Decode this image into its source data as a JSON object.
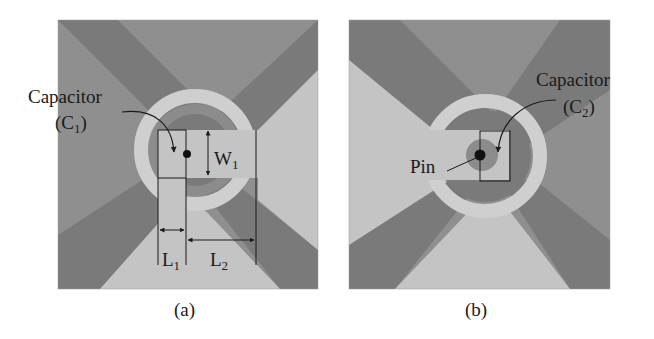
{
  "figure": {
    "panel_a": {
      "caption": "(a)",
      "capacitor_label": "Capacitor",
      "capacitor_sub_prefix": "(C",
      "capacitor_sub": "1",
      "capacitor_sub_suffix": ")",
      "dim_w1": "W",
      "dim_w1_sub": "1",
      "dim_l1": "L",
      "dim_l1_sub": "1",
      "dim_l2": "L",
      "dim_l2_sub": "2"
    },
    "panel_b": {
      "caption": "(b)",
      "capacitor_label": "Capacitor",
      "capacitor_sub_prefix": "(C",
      "capacitor_sub": "2",
      "capacitor_sub_suffix": ")",
      "pin_label": "Pin"
    },
    "colors": {
      "background": "#ffffff",
      "dark_gray": "#7a7a7a",
      "mid_gray": "#8f8f8f",
      "light_gray": "#c4c4c4",
      "ring": "#cfcfcf",
      "line": "#1a1a1a"
    }
  }
}
